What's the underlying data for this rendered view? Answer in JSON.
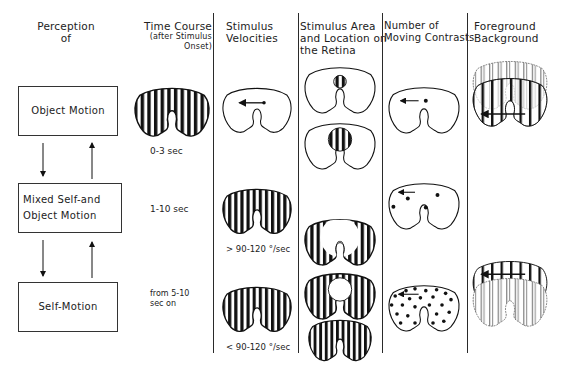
{
  "headers": {
    "perception": "Perception\nof",
    "time_course": "Time Course",
    "time_course_sub": "(after Stimulus Onset)",
    "stimulus_velocities": "Stimulus\nVelocities",
    "stimulus_area": "Stimulus Area\nand Location on\nthe Retina",
    "moving_contrasts": "Number of\nMoving Contrasts",
    "foreground_background": "Foreground\nBackground"
  },
  "perception_boxes": [
    {
      "label": "Object Motion"
    },
    {
      "label": "Mixed Self-and\nObject Motion"
    },
    {
      "label": "Self-Motion"
    }
  ],
  "time_course": [
    {
      "label": "0-3 sec"
    },
    {
      "label": "1-10 sec"
    },
    {
      "label": "from 5-10\nsec  on"
    }
  ],
  "velocities": [
    {
      "label": "> 90-120 °/sec"
    },
    {
      "label": "< 90-120 °/sec"
    }
  ],
  "colors": {
    "ink": "#1a1a1a",
    "background": "#ffffff",
    "stripe_gray": "#8a8a8a"
  }
}
